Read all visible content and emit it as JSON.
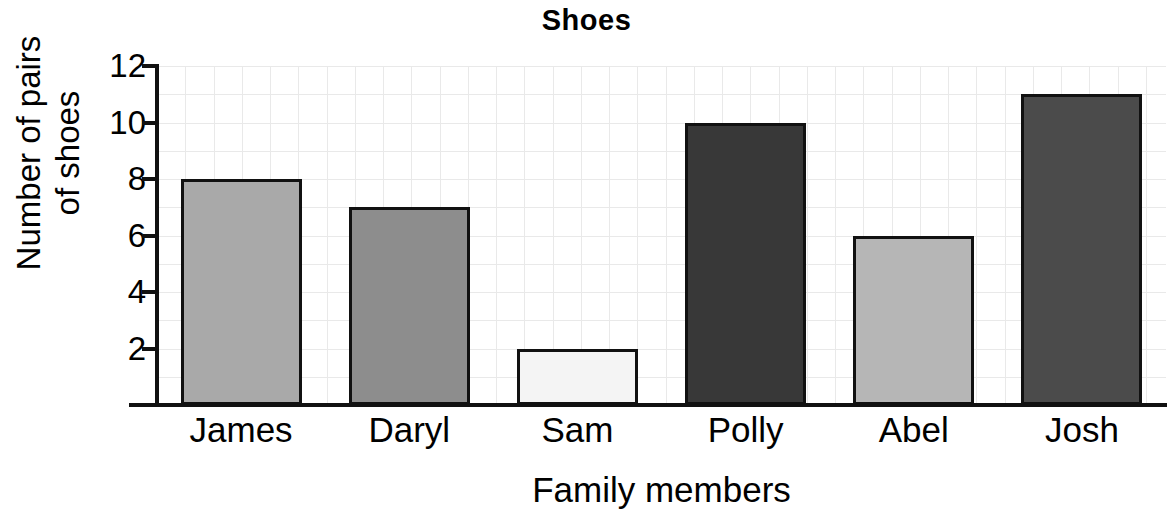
{
  "chart_data": {
    "type": "bar",
    "title": "Shoes",
    "xlabel": "Family members",
    "ylabel": "Number of pairs\nof shoes",
    "categories": [
      "James",
      "Daryl",
      "Sam",
      "Polly",
      "Abel",
      "Josh"
    ],
    "values": [
      8,
      7,
      2,
      10,
      6,
      11
    ],
    "bar_colors": [
      "#a9a9a9",
      "#8d8d8d",
      "#f4f4f4",
      "#383838",
      "#b6b6b6",
      "#4b4b4b"
    ],
    "bar_edge_color": "#111111",
    "ylim": [
      0,
      12
    ],
    "ytick_labels": [
      "2",
      "4",
      "6",
      "8",
      "10",
      "12"
    ],
    "ytick_values": [
      2,
      4,
      6,
      8,
      10,
      12
    ],
    "minor_grid_step": 1,
    "grid": true,
    "grid_color": "#e9e9e9",
    "legend": "none",
    "series": [
      {
        "name": "Number of pairs of shoes",
        "values": [
          8,
          7,
          2,
          10,
          6,
          11
        ]
      }
    ]
  }
}
